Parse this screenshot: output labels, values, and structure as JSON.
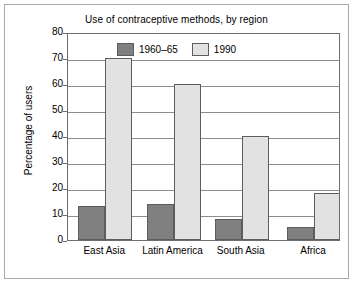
{
  "chart_data": {
    "type": "bar",
    "title": "Use of contraceptive methods, by region",
    "xlabel": "",
    "ylabel": "Percentage of users",
    "categories": [
      "East Asia",
      "Latin America",
      "South Asia",
      "Africa"
    ],
    "series": [
      {
        "name": "1960–65",
        "color": "#808080",
        "values": [
          13,
          14,
          8,
          5
        ]
      },
      {
        "name": "1990",
        "color": "#e2e2e2",
        "values": [
          70,
          60,
          40,
          18
        ]
      }
    ],
    "ylim": [
      0,
      80
    ],
    "ytick_step": 10,
    "yticks": [
      0,
      10,
      20,
      30,
      40,
      50,
      60,
      70,
      80
    ],
    "ytick_labels": [
      "0",
      "10",
      "20",
      "30",
      "40",
      "50",
      "60",
      "70",
      "80"
    ],
    "grid": true,
    "grid_axis": "y",
    "legend_position": "top-center",
    "border_color": "#6e6e6e",
    "bar_edge_color": "#5d5d5d"
  }
}
